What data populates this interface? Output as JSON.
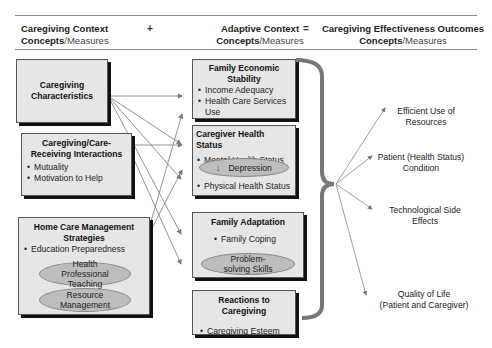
{
  "header": {
    "col1": {
      "line1": "Caregiving Context",
      "bold2": "Concepts",
      "light2": "/Measures"
    },
    "op1": "+",
    "col2": {
      "line1": "Adaptive Context",
      "bold2": "Concepts",
      "light2": "/Measures"
    },
    "op2": "=",
    "col3": {
      "line1": "Caregiving Effectiveness Outcomes",
      "bold2": "Concepts",
      "light2": "/Measures"
    }
  },
  "context_boxes": [
    {
      "title": "Caregiving Characteristics",
      "items": []
    },
    {
      "title": "Caregiving/Care-Receiving Interactions",
      "items": [
        "Mutuality",
        "Motivation to Help"
      ]
    },
    {
      "title": "Home Care Management Strategies",
      "items": [
        "Education Preparedness"
      ],
      "ovals": [
        "Health Professional Teaching",
        "Resource Management"
      ]
    }
  ],
  "adaptive_boxes": [
    {
      "title": "Family Economic Stability",
      "items": [
        "Income Adequacy",
        "Health Care Services Use"
      ]
    },
    {
      "title": "Caregiver Health Status",
      "items": [
        "Mental Health Status",
        "Physical Health Status"
      ],
      "ovals": [
        "Depression"
      ],
      "oval_icon": "down-arrow-icon"
    },
    {
      "title": "Family Adaptation",
      "items": [
        "Family Coping"
      ],
      "ovals": [
        "Problem-solving Skills"
      ]
    },
    {
      "title": "Reactions to Caregiving",
      "items": [
        "Caregiving Esteem"
      ]
    }
  ],
  "outcomes": [
    {
      "line1": "Efficient Use of",
      "line2": "Resources"
    },
    {
      "line1": "Patient (Health Status)",
      "line2": "Condition"
    },
    {
      "line1": "Technological Side",
      "line2": "Effects"
    },
    {
      "line1": "Quality of Life",
      "line2": "(Patient and Caregiver)"
    }
  ],
  "colors": {
    "box_fill": "#e6e6e6",
    "shadow": "#111111",
    "oval_fill": "#bdbdbd",
    "bracket": "#777777",
    "arrow": "#777777"
  }
}
